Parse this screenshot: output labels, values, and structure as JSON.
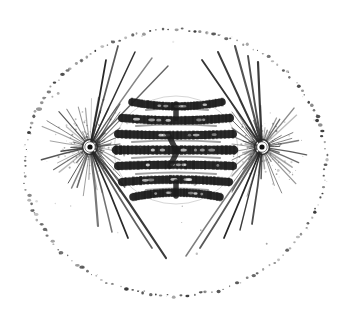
{
  "image": {
    "kind": "scientific-illustration",
    "subject": "Animal cell in mitosis (metaphase) showing mitotic spindle, asters and equatorial chromosome plate",
    "style": "monochrome stipple / line engraving, grayscale on white",
    "width": 351,
    "height": 315,
    "background_color": "#ffffff",
    "ink_color": "#1a1a1a",
    "has_text_labels": false,
    "title": "",
    "caption": ""
  },
  "cell_membrane": {
    "name": "cell-membrane",
    "shape": "ellipse",
    "stroke_style": "dotted-stippled",
    "center_x": 175,
    "center_y": 163,
    "radius_x": 151,
    "radius_y": 133,
    "dot_count": 150,
    "dot_color": "#2b2b2b",
    "dot_min_radius": 0.55,
    "dot_max_radius": 1.85,
    "rotation_deg": -2
  },
  "poles": [
    {
      "name": "aster-left",
      "centrosome_x": 90,
      "centrosome_y": 147,
      "centriole_radius": 2.6,
      "inner_halo_radius": 5.2,
      "outer_ring_radius": 7.4,
      "ray_count": 44,
      "short_ray_min": 9,
      "short_ray_max": 46,
      "color": "#2a2a2a",
      "side": "left"
    },
    {
      "name": "aster-right",
      "centrosome_x": 262,
      "centrosome_y": 147,
      "centriole_radius": 2.6,
      "inner_halo_radius": 5.2,
      "outer_ring_radius": 7.4,
      "ray_count": 44,
      "short_ray_min": 9,
      "short_ray_max": 46,
      "color": "#2a2a2a",
      "side": "right"
    }
  ],
  "long_astral_rays": {
    "name": "long-astral-rays",
    "color": "#232323",
    "width": 1.5,
    "from_left_pole": [
      {
        "x": 118,
        "y": 46
      },
      {
        "x": 135,
        "y": 52
      },
      {
        "x": 152,
        "y": 58
      },
      {
        "x": 168,
        "y": 66
      },
      {
        "x": 106,
        "y": 60
      },
      {
        "x": 152,
        "y": 248
      },
      {
        "x": 166,
        "y": 258
      },
      {
        "x": 128,
        "y": 238
      },
      {
        "x": 112,
        "y": 232
      },
      {
        "x": 98,
        "y": 226
      }
    ],
    "from_right_pole": [
      {
        "x": 235,
        "y": 46
      },
      {
        "x": 218,
        "y": 52
      },
      {
        "x": 202,
        "y": 60
      },
      {
        "x": 248,
        "y": 56
      },
      {
        "x": 258,
        "y": 62
      },
      {
        "x": 200,
        "y": 248
      },
      {
        "x": 186,
        "y": 256
      },
      {
        "x": 224,
        "y": 238
      },
      {
        "x": 240,
        "y": 230
      },
      {
        "x": 252,
        "y": 224
      }
    ]
  },
  "spindle_fibers": {
    "name": "spindle-fibers",
    "color": "#3a3a3a",
    "width": 1.1,
    "left_targets_y": [
      104,
      112,
      120,
      128,
      136,
      144,
      152,
      160,
      168,
      176,
      184,
      192
    ],
    "right_targets_y": [
      104,
      112,
      120,
      128,
      136,
      144,
      152,
      160,
      168,
      176,
      184,
      192
    ],
    "plate_left_x": 120,
    "plate_right_x": 232
  },
  "chromosome_plate": {
    "name": "chromosome-plate",
    "description": "Equatorial metaphase plate of thick dark chromosomes",
    "center_x": 176,
    "center_y": 150,
    "half_width": 60,
    "half_height": 56,
    "color": "#1c1c1c",
    "band_count": 7,
    "bands": [
      {
        "y": 102,
        "x_left": 132,
        "x_right": 222,
        "thickness": 7.5,
        "curve": -7
      },
      {
        "y": 118,
        "x_left": 122,
        "x_right": 230,
        "thickness": 8.0,
        "curve": -4
      },
      {
        "y": 134,
        "x_left": 118,
        "x_right": 233,
        "thickness": 8.0,
        "curve": -2
      },
      {
        "y": 150,
        "x_left": 116,
        "x_right": 234,
        "thickness": 8.5,
        "curve": 0
      },
      {
        "y": 166,
        "x_left": 118,
        "x_right": 233,
        "thickness": 8.0,
        "curve": 2
      },
      {
        "y": 182,
        "x_left": 122,
        "x_right": 229,
        "thickness": 8.0,
        "curve": 4
      },
      {
        "y": 197,
        "x_left": 133,
        "x_right": 220,
        "thickness": 7.5,
        "curve": 7
      }
    ],
    "inner_strands": [
      {
        "y": 110,
        "x_left": 146,
        "x_right": 208
      },
      {
        "y": 126,
        "x_left": 136,
        "x_right": 216
      },
      {
        "y": 142,
        "x_left": 132,
        "x_right": 220
      },
      {
        "y": 158,
        "x_left": 132,
        "x_right": 220
      },
      {
        "y": 174,
        "x_left": 136,
        "x_right": 216
      },
      {
        "y": 190,
        "x_left": 146,
        "x_right": 208
      }
    ],
    "outline_left_x": 114,
    "outline_right_x": 236,
    "outline_top_y": 96,
    "outline_bottom_y": 204
  },
  "cytoplasm_specks": {
    "name": "cytoplasm-specks",
    "color": "#555555",
    "count": 22
  }
}
